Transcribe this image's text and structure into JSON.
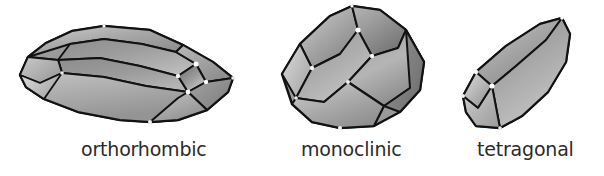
{
  "figure": {
    "background_color": "#ffffff",
    "width": 604,
    "height": 176
  },
  "palette": {
    "outline": "#121212",
    "label_text": "#2b2b2b",
    "face_light": "#d8d8d8",
    "face_mid": "#a8a8a8",
    "face_dark": "#6e6e6e",
    "face_darkest": "#555555",
    "highlight": "#ffffff"
  },
  "crystals": [
    {
      "id": "orthorhombic",
      "label": "orthorhombic",
      "description": "elongated blocky prism lying on its side with faceted terminations",
      "faces_visible": 9
    },
    {
      "id": "monoclinic",
      "label": "monoclinic",
      "description": "tilted prism with oblique angled terminations",
      "faces_visible": 7
    },
    {
      "id": "tetragonal",
      "label": "tetragonal",
      "description": "elongated square prism with flat end face",
      "faces_visible": 4
    }
  ],
  "labels": {
    "orthorhombic": "orthorhombic",
    "monoclinic": "monoclinic",
    "tetragonal": "tetragonal"
  }
}
